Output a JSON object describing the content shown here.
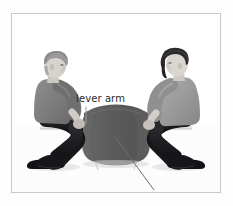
{
  "figure": {
    "name": "lever-and-pivot-photo-diagram",
    "background_color": "#ffffff",
    "frame_color": "#c9c9c9"
  },
  "annotations": [
    {
      "id": "lever-arm",
      "label": "lever arm",
      "leader": "vertical-line",
      "text_color": "#2b2b2b",
      "leader_color": "#9a9a9a"
    },
    {
      "id": "pivot",
      "label": "pivot",
      "leader": "diagonal-line",
      "text_color": "#2b2b2b",
      "leader_color": "#6e6e6e"
    }
  ],
  "scene": {
    "ground_color": "#ffffff",
    "plank": {
      "name": "lever arm",
      "color": "#efefef",
      "edge_color": "#cfcfcf"
    },
    "pivot_drum": {
      "name": "pivot",
      "body_color": "#5d5d5d",
      "rim_color": "#4a4a4a",
      "shade_color": "#565656"
    },
    "children": [
      {
        "id": "child-left",
        "facing": "right",
        "hair_color": "#8e8e8e",
        "skin_color": "#d6d3cd",
        "shirt_color": "#7c7c7c",
        "pants_color": "#1f1f23",
        "shoe_color": "#141416"
      },
      {
        "id": "child-right",
        "facing": "left",
        "hair_color": "#2a2a2c",
        "skin_color": "#d9d6d0",
        "shirt_color": "#9a9a9a",
        "pants_color": "#1a1a1d",
        "shoe_color": "#141416"
      }
    ]
  }
}
